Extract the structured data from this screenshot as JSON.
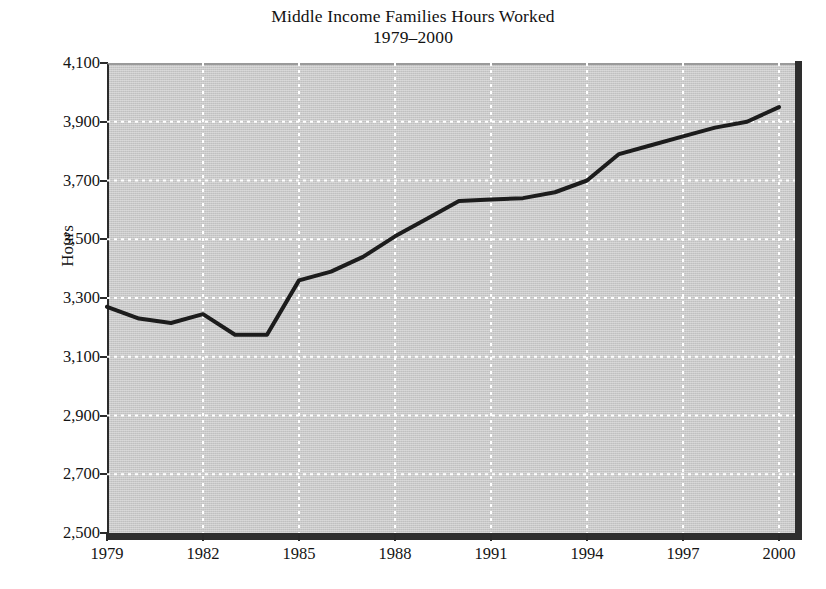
{
  "chart_data": {
    "type": "line",
    "title": "Middle Income Families Hours Worked",
    "subtitle": "1979–2000",
    "xlabel": "",
    "ylabel": "Hours",
    "xlim": [
      1979,
      2000.5
    ],
    "ylim": [
      2500,
      4100
    ],
    "grid": true,
    "legend": null,
    "x": [
      1979,
      1980,
      1981,
      1982,
      1983,
      1984,
      1985,
      1986,
      1987,
      1988,
      1989,
      1990,
      1991,
      1992,
      1993,
      1994,
      1995,
      1996,
      1997,
      1998,
      1999,
      2000
    ],
    "series": [
      {
        "name": "Hours Worked",
        "color": "#1c1c1c",
        "values": [
          3270,
          3230,
          3215,
          3245,
          3175,
          3175,
          3360,
          3390,
          3440,
          3510,
          3570,
          3630,
          3635,
          3640,
          3660,
          3700,
          3790,
          3820,
          3850,
          3880,
          3900,
          3950
        ]
      }
    ],
    "x_ticks": [
      1979,
      1982,
      1985,
      1988,
      1991,
      1994,
      1997,
      2000
    ],
    "x_tick_labels": [
      "1979",
      "1982",
      "1985",
      "1988",
      "1991",
      "1994",
      "1997",
      "2000"
    ],
    "y_ticks": [
      2500,
      2700,
      2900,
      3100,
      3300,
      3500,
      3700,
      3900,
      4100
    ],
    "y_tick_labels": [
      "2,500",
      "2,700",
      "2,900",
      "3,100",
      "3,300",
      "3,500",
      "3,700",
      "3,900",
      "4,100"
    ],
    "colors": {
      "plot_background": "#c9c9c9",
      "gridline": "#ffffff",
      "line": "#1c1c1c",
      "axis": "#2b2b2b",
      "text": "#121212"
    }
  }
}
